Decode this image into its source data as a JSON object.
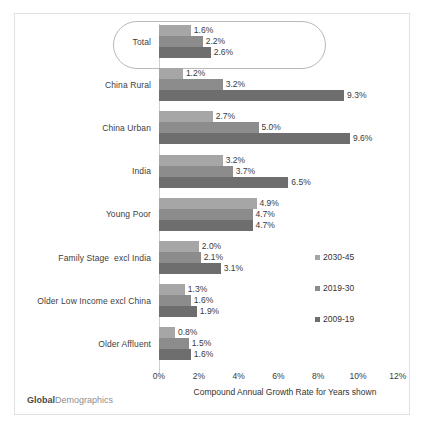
{
  "brand": {
    "part1": "Global",
    "part2": "Demographics"
  },
  "chart_data": {
    "type": "bar",
    "orientation": "horizontal",
    "title": "",
    "xlabel": "Compound Annual Growth Rate for Years shown",
    "ylabel": "",
    "xlim": [
      0,
      12
    ],
    "xtick_labels": [
      "0%",
      "2%",
      "4%",
      "6%",
      "8%",
      "10%",
      "12%"
    ],
    "xtick_values": [
      0,
      2,
      4,
      6,
      8,
      10,
      12
    ],
    "grid": false,
    "legend_position": "right",
    "categories": [
      "Total",
      "China Rural",
      "China Urban",
      "India",
      "Young Poor",
      "Family Stage  excl India",
      "Older Low Income excl China",
      "Older Affluent"
    ],
    "highlighted_category": "Total",
    "series": [
      {
        "name": "2030-45",
        "color": "#a6a6a6",
        "values": [
          1.6,
          1.2,
          2.7,
          3.2,
          4.9,
          2.0,
          1.3,
          0.8
        ],
        "labels": [
          "1.6%",
          "1.2%",
          "2.7%",
          "3.2%",
          "4.9%",
          "2.0%",
          "1.3%",
          "0.8%"
        ]
      },
      {
        "name": "2019-30",
        "color": "#8c8c8c",
        "values": [
          2.2,
          3.2,
          5.0,
          3.7,
          4.7,
          2.1,
          1.6,
          1.5
        ],
        "labels": [
          "2.2%",
          "3.2%",
          "5.0%",
          "3.7%",
          "4.7%",
          "2.1%",
          "1.6%",
          "1.5%"
        ]
      },
      {
        "name": "2009-19",
        "color": "#6e6e6e",
        "values": [
          2.6,
          9.3,
          9.6,
          6.5,
          4.7,
          3.1,
          1.9,
          1.6
        ],
        "labels": [
          "2.6%",
          "9.3%",
          "9.6%",
          "6.5%",
          "4.7%",
          "3.1%",
          "1.9%",
          "1.6%"
        ]
      }
    ]
  }
}
